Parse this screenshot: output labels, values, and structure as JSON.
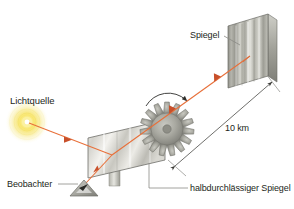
{
  "diagram": {
    "background_color": "#ffffff",
    "width": 294,
    "height": 209,
    "labels": {
      "light_source": "Lichtquelle",
      "mirror": "Spiegel",
      "observer": "Beobachter",
      "half_mirror": "halbdurchlässiger Spiegel",
      "distance": "10 km"
    },
    "colors": {
      "beam": "#e8703a",
      "beam_dark": "#c8502a",
      "glow": "#f5e14a",
      "metal_light": "#f2f2f0",
      "metal_mid": "#b9b9b3",
      "metal_dark": "#8d8d86",
      "outline": "#6b6b66",
      "text": "#231f20",
      "leader": "#8a8a85"
    },
    "elements": {
      "light_source_icon": "glowing-light-source",
      "mirror_icon": "flat-mirror-panel",
      "half_mirror_icon": "half-silvered-mirror-panel",
      "cogwheel_icon": "toothed-rotating-wheel",
      "observer_icon": "observer-eye-triangle",
      "rotation_arrow_icon": "rotation-direction-arrow",
      "dimension_arrow_icon": "double-headed-dimension-arrow"
    }
  }
}
